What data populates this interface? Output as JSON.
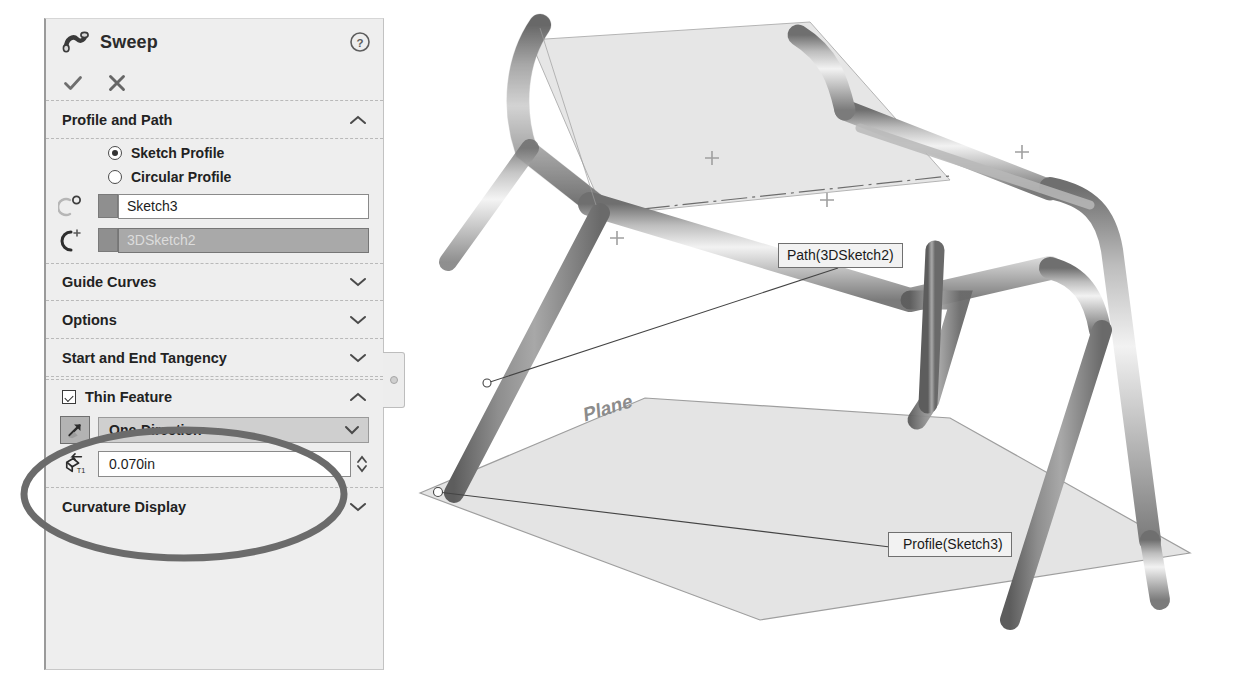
{
  "panel": {
    "title": "Sweep",
    "title_icon": "sweep-icon",
    "help_icon": "help-icon",
    "accept_icon": "checkmark-icon",
    "cancel_icon": "close-icon",
    "sections": {
      "profile_and_path": {
        "label": "Profile and Path",
        "expanded": true,
        "chevron": "chevron-up-icon",
        "radios": [
          {
            "label": "Sketch Profile",
            "selected": true
          },
          {
            "label": "Circular Profile",
            "selected": false
          }
        ],
        "selections": [
          {
            "icon": "profile-selector-icon",
            "value": "Sketch3",
            "selected": false
          },
          {
            "icon": "path-selector-icon",
            "value": "3DSketch2",
            "selected": true
          }
        ]
      },
      "guide_curves": {
        "label": "Guide Curves",
        "expanded": false,
        "chevron": "chevron-down-icon"
      },
      "options": {
        "label": "Options",
        "expanded": false,
        "chevron": "chevron-down-icon"
      },
      "start_and_end_tangency": {
        "label": "Start and End Tangency",
        "expanded": false,
        "chevron": "chevron-down-icon"
      },
      "thin_feature": {
        "label": "Thin Feature",
        "checked": true,
        "expanded": true,
        "chevron": "chevron-up-icon",
        "direction": {
          "icon": "thin-direction-icon",
          "value": "One-Direction",
          "chevron": "chevron-down-icon"
        },
        "thickness": {
          "icon": "thickness-t1-icon",
          "value": "0.070in",
          "spinner": "spinner-icon"
        }
      },
      "curvature_display": {
        "label": "Curvature Display",
        "expanded": false,
        "chevron": "chevron-down-icon"
      }
    },
    "resize_tab": "panel-pin-tab"
  },
  "viewport": {
    "callouts": [
      {
        "id": "path",
        "text": "Path(3DSketch2)"
      },
      {
        "id": "profile",
        "text": "Profile(Sketch3)"
      }
    ],
    "plane_label": "Plane",
    "model": "tubular-chair-frame"
  },
  "annotation": {
    "type": "ellipse-highlight",
    "color": "#6b6b6b",
    "stroke_width": 7
  },
  "colors": {
    "panel_bg": "#eeeeee",
    "field_bg": "#ffffff",
    "selected_field_bg": "#a9a9a9",
    "dropdown_bg": "#cfcfcf",
    "border": "#8a8a8a",
    "text": "#222222",
    "annotation": "#6b6b6b",
    "model_shade": "#9a9a9a",
    "plane_fill": "#e2e2e2"
  }
}
